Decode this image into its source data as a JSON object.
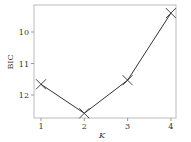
{
  "chart_data": {
    "type": "line",
    "title": "",
    "xlabel": "K",
    "ylabel": "BIC",
    "x": [
      1,
      2,
      3,
      4
    ],
    "categories": [
      "1",
      "2",
      "3",
      "4"
    ],
    "series": [
      {
        "name": "BIC",
        "values": [
          11.66,
          12.58,
          11.53,
          9.4
        ],
        "marker": "x",
        "color": "#333333"
      }
    ],
    "xticks": [
      "1",
      "2",
      "3",
      "4"
    ],
    "yticks": [
      "10",
      "11",
      "12"
    ],
    "ylim": [
      12.7,
      9.3
    ],
    "y_inverted": true,
    "grid": false,
    "legend": false
  },
  "labels": {
    "xlabel": "K",
    "ylabel": "BIC",
    "xticks": [
      "1",
      "2",
      "3",
      "4"
    ],
    "yticks": [
      "10",
      "11",
      "12"
    ]
  }
}
